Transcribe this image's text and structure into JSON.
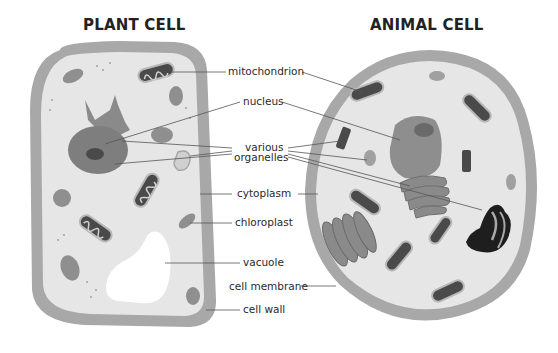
{
  "titles": {
    "plant": "PLANT CELL",
    "animal": "ANIMAL CELL"
  },
  "labels": {
    "mitochondrion": "mitochondrion",
    "nucleus": "nucleus",
    "various": "various",
    "organelles": "organelles",
    "cytoplasm": "cytoplasm",
    "chloroplast": "chloroplast",
    "vacuole": "vacuole",
    "cell_membrane": "cell membrane",
    "cell_wall": "cell wall"
  },
  "colors": {
    "cell_wall": "#a8a8a8",
    "cytoplasm": "#e6e6e6",
    "organelle": "#8f8f8f",
    "nucleus": "#7e7e7e",
    "dark": "#3a3a3a",
    "golgi_dark": "#1e1e1e",
    "vacuole": "#ffffff",
    "leader_line": "#555555"
  }
}
